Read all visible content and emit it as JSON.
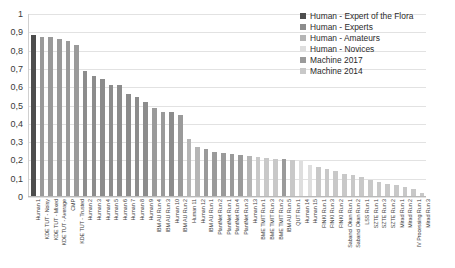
{
  "chart_data": {
    "type": "bar",
    "title": "",
    "xlabel": "",
    "ylabel": "",
    "ylim": [
      0,
      1
    ],
    "yticks": [
      "1",
      "0,9",
      "0,8",
      "0,7",
      "0,6",
      "0,5",
      "0,4",
      "0,3",
      "0,2",
      "0,1",
      "0"
    ],
    "grid": true,
    "legend_position": "top-right",
    "legend": [
      {
        "label": "Human - Expert of the Flora",
        "color": "#4d4d4d"
      },
      {
        "label": "Human - Experts",
        "color": "#8c8c8c"
      },
      {
        "label": "Human - Amateurs",
        "color": "#b5b5b5"
      },
      {
        "label": "Human - Novices",
        "color": "#dedede"
      },
      {
        "label": "Machine 2017",
        "color": "#9a9a9a"
      },
      {
        "label": "Machine 2014",
        "color": "#c8c8c8"
      }
    ],
    "categories": [
      "Human 1",
      "KDE TUT - Noisy",
      "KDE TUT - Mixed",
      "KDE TUT - Average",
      "CMP",
      "KDE TUT - Trusted",
      "Human 2",
      "Human 3",
      "Human 4",
      "Human 5",
      "Human 6",
      "Human 7",
      "Human 8",
      "Human 9",
      "IBM AU Run 4",
      "IBM AU Run 3",
      "Human 10",
      "IBM AU Run 2",
      "Human 11",
      "Human 12",
      "IBM AU Run 1",
      "PlantNet Run 2",
      "PlantNet Run 1",
      "PlantNet Run 4",
      "PlantNet Run 3",
      "Human 13",
      "BME TMIT Run 1",
      "BME TMIT Run 3",
      "BME TMIT Run 2",
      "IBM AU Run 5",
      "QUT Run 1",
      "Human 14",
      "Human 15",
      "FINKI Run 1",
      "FINKI Run 3",
      "FINKI Run 2",
      "Sabanci Okan Run 1",
      "Sabanci Okan Run 2",
      "LSS Run 1",
      "SZTE Run 1",
      "SZTE Run 3",
      "SZTE Run 2",
      "Mirad Run 1",
      "Mirad Run 2",
      "IV Processing Run 1",
      "Mirad Run 3"
    ],
    "values": [
      0.88,
      0.87,
      0.868,
      0.86,
      0.845,
      0.826,
      0.681,
      0.655,
      0.638,
      0.607,
      0.606,
      0.559,
      0.54,
      0.516,
      0.48,
      0.461,
      0.46,
      0.445,
      0.31,
      0.268,
      0.258,
      0.239,
      0.234,
      0.229,
      0.222,
      0.218,
      0.215,
      0.206,
      0.204,
      0.2,
      0.197,
      0.19,
      0.172,
      0.158,
      0.149,
      0.135,
      0.12,
      0.114,
      0.102,
      0.089,
      0.075,
      0.066,
      0.058,
      0.049,
      0.04,
      0.017
    ],
    "group_of_bar": [
      "expert",
      "machine2017",
      "machine2017",
      "machine2017",
      "machine2017",
      "machine2017",
      "experts",
      "experts",
      "experts",
      "experts",
      "experts",
      "experts",
      "experts",
      "experts",
      "machine2017",
      "machine2017",
      "experts",
      "machine2017",
      "amateurs",
      "amateurs",
      "machine2017",
      "machine2017",
      "machine2017",
      "machine2017",
      "machine2017",
      "amateurs",
      "machine2014",
      "machine2014",
      "machine2014",
      "machine2017",
      "machine2014",
      "novices",
      "novices",
      "machine2014",
      "machine2014",
      "machine2014",
      "machine2014",
      "machine2014",
      "machine2014",
      "machine2014",
      "machine2014",
      "machine2014",
      "machine2014",
      "machine2014",
      "machine2014",
      "machine2014"
    ],
    "group_colors": {
      "expert": "#4d4d4d",
      "experts": "#8c8c8c",
      "amateurs": "#b5b5b5",
      "novices": "#dedede",
      "machine2017": "#9a9a9a",
      "machine2014": "#c8c8c8"
    }
  }
}
